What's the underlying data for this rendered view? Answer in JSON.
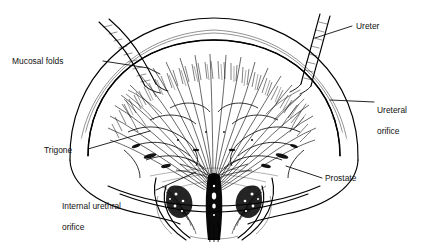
{
  "figure": {
    "type": "anatomical-line-illustration",
    "style": "pen-and-ink hatching, black on white",
    "ink_color": "#000000",
    "background_color": "#ffffff"
  },
  "labels": [
    {
      "id": "mucosal-folds",
      "text": "Mucosal folds",
      "lines": [
        "Mucosal folds"
      ],
      "target": "bladder mucosa rugae on upper left wall"
    },
    {
      "id": "ureter",
      "text": "Ureter",
      "lines": [
        "Ureter"
      ],
      "target": "right ureter tube entering bladder"
    },
    {
      "id": "ureteral-orifice",
      "text": "Ureteral orifice",
      "lines": [
        "Ureteral",
        "orifice"
      ],
      "target": "opening of ureter into bladder, right side"
    },
    {
      "id": "trigone",
      "text": "Trigone",
      "lines": [
        "Trigone"
      ],
      "target": "smooth triangular region of bladder floor"
    },
    {
      "id": "internal-urethral-orifice",
      "text": "Internal urethral orifice",
      "lines": [
        "Internal urethral",
        "orifice"
      ],
      "target": "bladder neck opening into urethra"
    },
    {
      "id": "prostate",
      "text": "Prostate",
      "lines": [
        "Prostate"
      ],
      "target": "prostate gland below bladder neck"
    }
  ]
}
